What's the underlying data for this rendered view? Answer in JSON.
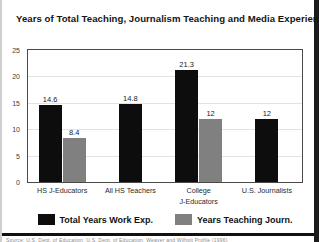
{
  "chart_data": {
    "type": "bar",
    "title": "Years of  Total Teaching, Journalism Teaching and Media Experience",
    "xlabel": "",
    "ylabel": "",
    "ylim": [
      0,
      25
    ],
    "yticks": [
      0,
      5,
      10,
      15,
      20,
      25
    ],
    "ytick_labels": [
      "0",
      "5",
      "10",
      "15",
      "20",
      "25"
    ],
    "grid": true,
    "legend_position": "bottom",
    "categories": [
      "HS J-Educators",
      "All HS Teachers",
      "College\nJ-Educators",
      "U.S. Journalists"
    ],
    "category_lines": [
      [
        "HS J-Educators"
      ],
      [
        "All HS Teachers"
      ],
      [
        "College",
        "J-Educators"
      ],
      [
        "U.S. Journalists"
      ]
    ],
    "series": [
      {
        "name": "Total Years Work Exp.",
        "color": "#0d0d0d",
        "values": [
          14.6,
          14.8,
          21.3,
          12
        ],
        "labels": [
          "14.6",
          "14.8",
          "21.3",
          "12"
        ]
      },
      {
        "name": "Years Teaching Journ.",
        "color": "#808080",
        "values": [
          8.4,
          null,
          12,
          null
        ],
        "labels": [
          "8.4",
          "",
          "12",
          ""
        ]
      }
    ]
  },
  "figure": {
    "background": "#ffffff",
    "frame_color": "#4a4a4a",
    "gridline_color": "#e2e2e2"
  },
  "footnote": {
    "text": "Source: U.S. Dept. of Education, U.S. Dept. of Education, Weaver and Wilhoit Profile (1996)"
  }
}
